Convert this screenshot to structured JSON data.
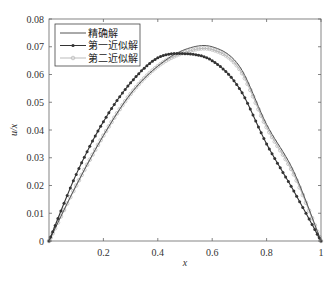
{
  "chart_data": {
    "type": "line",
    "title": "",
    "xlabel": "x",
    "ylabel": "u/x",
    "xlim": [
      0,
      1
    ],
    "ylim": [
      0,
      0.08
    ],
    "grid": false,
    "legend_position": "upper left",
    "x_ticks": [
      0.2,
      0.4,
      0.6,
      0.8,
      1
    ],
    "x_tick_labels": [
      "0.2",
      "0.4",
      "0.6",
      "0.8",
      "1"
    ],
    "y_ticks": [
      0,
      0.01,
      0.02,
      0.03,
      0.04,
      0.05,
      0.06,
      0.07,
      0.08
    ],
    "y_tick_labels": [
      "0",
      "0.01",
      "0.02",
      "0.03",
      "0.04",
      "0.05",
      "0.06",
      "0.07",
      "0.08"
    ],
    "x": [
      0,
      0.1,
      0.2,
      0.3,
      0.4,
      0.5,
      0.6,
      0.7,
      0.8,
      0.9,
      1.0
    ],
    "series": [
      {
        "name": "精确解",
        "color": "#555555",
        "marker": "none",
        "values": [
          0,
          0.02,
          0.038,
          0.053,
          0.063,
          0.069,
          0.07,
          0.063,
          0.042,
          0.025,
          0
        ]
      },
      {
        "name": "第一近似解",
        "color": "#333333",
        "marker": "dot",
        "values": [
          0,
          0.024,
          0.043,
          0.057,
          0.066,
          0.0675,
          0.065,
          0.055,
          0.035,
          0.018,
          0
        ]
      },
      {
        "name": "第二近似解",
        "color": "#bbbbbb",
        "marker": "circle",
        "values": [
          0,
          0.02,
          0.038,
          0.053,
          0.063,
          0.068,
          0.069,
          0.062,
          0.041,
          0.024,
          0
        ]
      }
    ]
  }
}
